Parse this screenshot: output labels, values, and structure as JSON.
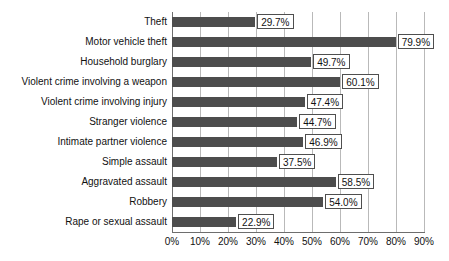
{
  "chart_data": {
    "type": "bar",
    "orientation": "horizontal",
    "title": "",
    "subtitle": "",
    "xlabel": "",
    "ylabel": "",
    "xlim": [
      0,
      90
    ],
    "xtick_step": 10,
    "grid": true,
    "legend": null,
    "bar_color": "#4d4d4d",
    "gridline_color": "#b9b9b9",
    "axis_color": "#6e6e6e",
    "value_suffix": "%",
    "tick_labels": [
      "0%",
      "10%",
      "20%",
      "30%",
      "40%",
      "50%",
      "60%",
      "70%",
      "80%",
      "90%"
    ],
    "tick_values": [
      0,
      10,
      20,
      30,
      40,
      50,
      60,
      70,
      80,
      90
    ],
    "categories": [
      "Theft",
      "Motor vehicle theft",
      "Household burglary",
      "Violent crime involving a weapon",
      "Violent crime involving injury",
      "Stranger violence",
      "Intimate partner violence",
      "Simple assault",
      "Aggravated assault",
      "Robbery",
      "Rape or sexual assault"
    ],
    "values": [
      29.7,
      79.9,
      49.7,
      60.1,
      47.4,
      44.7,
      46.9,
      37.5,
      58.5,
      54.0,
      22.9
    ],
    "value_labels": [
      "29.7%",
      "79.9%",
      "49.7%",
      "60.1%",
      "47.4%",
      "44.7%",
      "46.9%",
      "37.5%",
      "58.5%",
      "54.0%",
      "22.9%"
    ]
  }
}
